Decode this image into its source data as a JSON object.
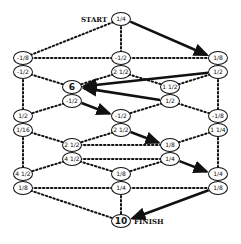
{
  "diagram": {
    "start_label": "START",
    "finish_label": "FINISH",
    "nodes": [
      {
        "id": "start",
        "x": 121,
        "y": 19,
        "text": "1/4"
      },
      {
        "id": "l1a",
        "x": 23,
        "y": 58,
        "text": "-1/8"
      },
      {
        "id": "l1b",
        "x": 23,
        "y": 72,
        "text": "-1/2"
      },
      {
        "id": "m1a",
        "x": 121,
        "y": 58,
        "text": "-1/2"
      },
      {
        "id": "m1b",
        "x": 121,
        "y": 72,
        "text": "2 1/2"
      },
      {
        "id": "r1a",
        "x": 218,
        "y": 58,
        "text": "1/8"
      },
      {
        "id": "r1b",
        "x": 218,
        "y": 72,
        "text": "1/2"
      },
      {
        "id": "l2a",
        "x": 72,
        "y": 87,
        "text": "6",
        "big": true
      },
      {
        "id": "l2b",
        "x": 72,
        "y": 101,
        "text": "-1/2"
      },
      {
        "id": "r2a",
        "x": 170,
        "y": 87,
        "text": "1 1/2"
      },
      {
        "id": "r2b",
        "x": 170,
        "y": 101,
        "text": "1/2"
      },
      {
        "id": "l3a",
        "x": 23,
        "y": 116,
        "text": "1/2"
      },
      {
        "id": "l3b",
        "x": 23,
        "y": 130,
        "text": "1/16"
      },
      {
        "id": "m3a",
        "x": 121,
        "y": 116,
        "text": "-1/2"
      },
      {
        "id": "m3b",
        "x": 121,
        "y": 130,
        "text": "2 1/2"
      },
      {
        "id": "r3a",
        "x": 218,
        "y": 116,
        "text": "-1/8"
      },
      {
        "id": "r3b",
        "x": 218,
        "y": 130,
        "text": "1 1/4"
      },
      {
        "id": "l4a",
        "x": 72,
        "y": 145,
        "text": "2 1/2"
      },
      {
        "id": "l4b",
        "x": 72,
        "y": 159,
        "text": "4 1/2"
      },
      {
        "id": "r4a",
        "x": 170,
        "y": 145,
        "text": "1/8"
      },
      {
        "id": "r4b",
        "x": 170,
        "y": 159,
        "text": "1/4"
      },
      {
        "id": "l5a",
        "x": 23,
        "y": 174,
        "text": "4 1/2"
      },
      {
        "id": "l5b",
        "x": 23,
        "y": 188,
        "text": "1/8"
      },
      {
        "id": "m5a",
        "x": 121,
        "y": 174,
        "text": "1/8"
      },
      {
        "id": "m5b",
        "x": 121,
        "y": 188,
        "text": "1/4"
      },
      {
        "id": "r5a",
        "x": 218,
        "y": 174,
        "text": "1/4"
      },
      {
        "id": "r5b",
        "x": 218,
        "y": 188,
        "text": "1/8"
      },
      {
        "id": "finish",
        "x": 121,
        "y": 221,
        "text": "10",
        "big": true
      }
    ],
    "dotted_edges": [
      [
        "start",
        "l1a"
      ],
      [
        "start",
        "m1a"
      ],
      [
        "l1a",
        "m1a"
      ],
      [
        "m1a",
        "r1a"
      ],
      [
        "l1b",
        "l2a"
      ],
      [
        "m1b",
        "l2a"
      ],
      [
        "m1b",
        "r2a"
      ],
      [
        "r1b",
        "r2a"
      ],
      [
        "l1b",
        "l3a"
      ],
      [
        "r1b",
        "r3a"
      ],
      [
        "l2b",
        "l3a"
      ],
      [
        "r2b",
        "m3a"
      ],
      [
        "r2b",
        "r3a"
      ],
      [
        "l3b",
        "l4a"
      ],
      [
        "m3b",
        "l4a"
      ],
      [
        "r3b",
        "r4a"
      ],
      [
        "l3b",
        "l5a"
      ],
      [
        "r3b",
        "r5a"
      ],
      [
        "l4a",
        "r4a"
      ],
      [
        "l4b",
        "r4b"
      ],
      [
        "l4b",
        "l5a"
      ],
      [
        "l4b",
        "m5a"
      ],
      [
        "r4b",
        "m5a"
      ],
      [
        "l5b",
        "m5b"
      ],
      [
        "m5b",
        "r5b"
      ],
      [
        "l5b",
        "finish"
      ],
      [
        "m5b",
        "finish"
      ]
    ],
    "solid_arrows": [
      [
        "start",
        "r1a"
      ],
      [
        "r1b",
        "l2a"
      ],
      [
        "r2b",
        "l2a"
      ],
      [
        "l2b",
        "m3a"
      ],
      [
        "m3b",
        "r4a"
      ],
      [
        "r4b",
        "r5a"
      ],
      [
        "r5b",
        "finish"
      ]
    ]
  }
}
